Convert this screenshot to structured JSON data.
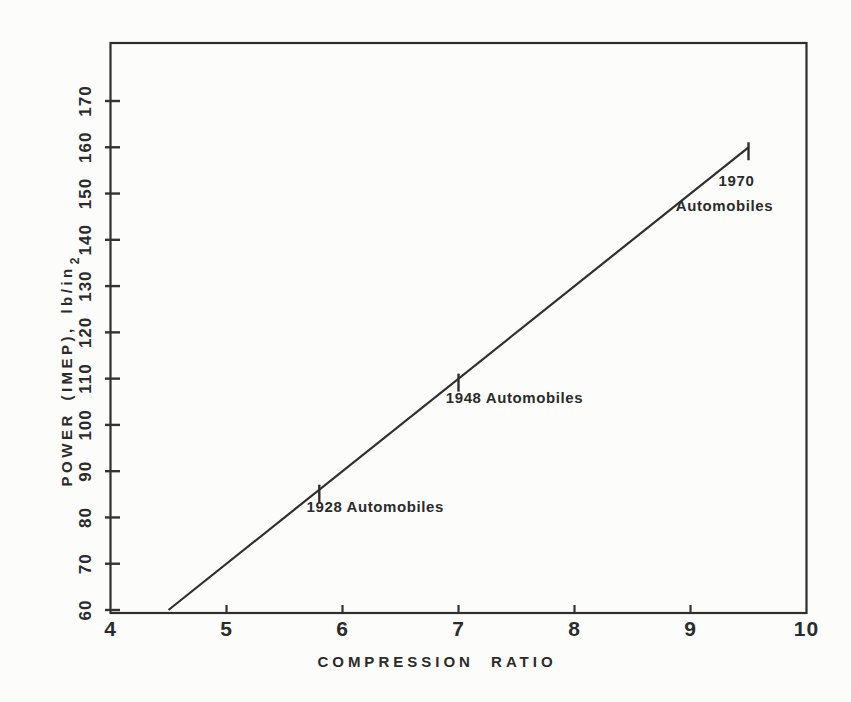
{
  "figure": {
    "background_color": "#fcfcfa",
    "ink_color": "#2b2b2b",
    "line_color": "#333333"
  },
  "chart_data": {
    "type": "line",
    "title": "",
    "xlabel": "COMPRESSION RATIO",
    "ylabel": "POWER (IMEP), lb/in",
    "ylabel_superscript": "2",
    "xlim": [
      4,
      10
    ],
    "ylim": [
      60,
      182
    ],
    "x_ticks": [
      4,
      5,
      6,
      7,
      8,
      9,
      10
    ],
    "y_ticks": [
      60,
      70,
      80,
      90,
      100,
      110,
      120,
      130,
      140,
      150,
      160,
      170
    ],
    "grid": false,
    "frame": "full-box",
    "legend": "none",
    "series": [
      {
        "name": "IMEP vs compression ratio",
        "x": [
          4.5,
          9.5
        ],
        "y": [
          60,
          160
        ]
      }
    ],
    "annotations": [
      {
        "x": 5.8,
        "y": 86,
        "lines": [
          {
            "text": "1928 Automobiles",
            "dx": 56,
            "dy": 22
          }
        ]
      },
      {
        "x": 7.0,
        "y": 110,
        "lines": [
          {
            "text": "1948 Automobiles",
            "dx": 56,
            "dy": 24
          }
        ]
      },
      {
        "x": 9.5,
        "y": 160,
        "lines": [
          {
            "text": "1970",
            "dx": -12,
            "dy": 39
          },
          {
            "text": "Automobiles",
            "dx": -24,
            "dy": 64
          }
        ]
      }
    ]
  }
}
